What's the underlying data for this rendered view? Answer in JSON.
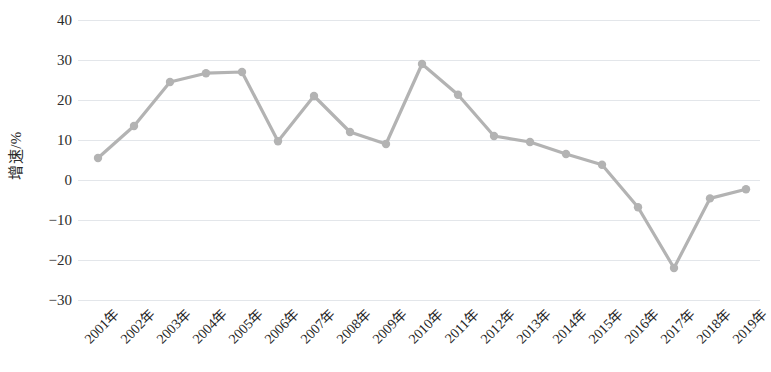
{
  "chart_data": {
    "type": "line",
    "title": "",
    "xlabel": "",
    "ylabel": "增速/%",
    "ylim": [
      -30,
      40
    ],
    "ytick_values": [
      40,
      30,
      20,
      10,
      0,
      -10,
      -20,
      -30
    ],
    "ytick_labels": [
      "40",
      "30",
      "20",
      "10",
      "0",
      "−10",
      "−20",
      "−30"
    ],
    "grid": true,
    "legend": "none",
    "categories": [
      "2001年",
      "2002年",
      "2003年",
      "2004年",
      "2005年",
      "2006年",
      "2007年",
      "2008年",
      "2009年",
      "2010年",
      "2011年",
      "2012年",
      "2013年",
      "2014年",
      "2015年",
      "2016年",
      "2017年",
      "2018年",
      "2019年"
    ],
    "values": [
      5.5,
      13.5,
      24.5,
      26.7,
      27.0,
      9.7,
      21.0,
      12.0,
      9.0,
      29.0,
      21.3,
      11.0,
      9.5,
      6.5,
      3.8,
      -6.8,
      -22.0,
      -4.6,
      -2.3
    ],
    "series": [
      {
        "name": "增速",
        "color": "#b3b3b3",
        "marker": "circle",
        "values": [
          5.5,
          13.5,
          24.5,
          26.7,
          27.0,
          9.7,
          21.0,
          12.0,
          9.0,
          29.0,
          21.3,
          11.0,
          9.5,
          6.5,
          3.8,
          -6.8,
          -22.0,
          -4.6,
          -2.3
        ]
      }
    ],
    "colors": {
      "line": "#b3b3b3",
      "marker": "#b3b3b3",
      "grid": "#e3e6ea",
      "text": "#222222",
      "background": "#ffffff"
    }
  }
}
